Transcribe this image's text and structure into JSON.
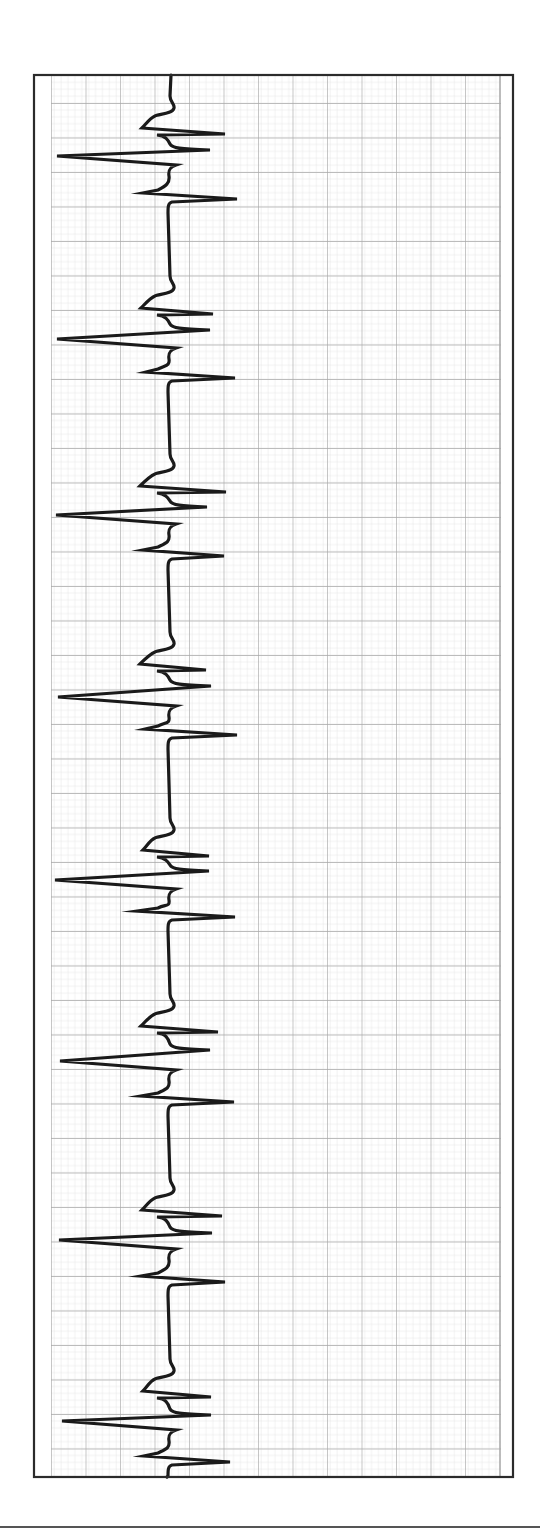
{
  "figure": {
    "caption_visible": "",
    "colors": {
      "frame": "#2b2b2b",
      "trace": "#1a1a1a",
      "grid_major": "#a8a8a8",
      "grid_minor": "#dddddd",
      "background": "#ffffff",
      "rule": "#555555"
    }
  },
  "chart_data": {
    "type": "line",
    "title": "",
    "xlabel": "",
    "ylabel": "",
    "orientation": "vertical strip (time runs top to bottom, amplitude left-right)",
    "grid": {
      "on": true,
      "major_spacing_px": 34.5,
      "minor_per_major": 5,
      "x_start_px": 51,
      "x_end_px": 500,
      "y_offset_px": 103
    },
    "frame_px": {
      "left": 33,
      "top": 74,
      "right": 514,
      "bottom": 1478
    },
    "baseline_x_px": 170,
    "beat_count": 8,
    "rr_interval_px": 181,
    "beats": [
      {
        "hook1": [
          142,
          128
        ],
        "spike1_x": 225,
        "spike2": [
          210,
          150
        ],
        "big_deflection": [
          57,
          156
        ],
        "hook2": [
          143,
          193
        ],
        "spike3_x": 237
      },
      {
        "hook1": [
          141,
          308
        ],
        "spike1_x": 213,
        "spike2": [
          210,
          330
        ],
        "big_deflection": [
          57,
          339
        ],
        "hook2": [
          146,
          372
        ],
        "spike3_x": 235
      },
      {
        "hook1": [
          140,
          486
        ],
        "spike1_x": 226,
        "spike2": [
          207,
          507
        ],
        "big_deflection": [
          56,
          515
        ],
        "hook2": [
          143,
          550
        ],
        "spike3_x": 224
      },
      {
        "hook1": [
          140,
          664
        ],
        "spike1_x": 206,
        "spike2": [
          211,
          686
        ],
        "big_deflection": [
          58,
          697
        ],
        "hook2": [
          145,
          729
        ],
        "spike3_x": 237
      },
      {
        "hook1": [
          143,
          850
        ],
        "spike1_x": 209,
        "spike2": [
          209,
          871
        ],
        "big_deflection": [
          55,
          880
        ],
        "hook2": [
          137,
          911
        ],
        "spike3_x": 235
      },
      {
        "hook1": [
          141,
          1026
        ],
        "spike1_x": 218,
        "spike2": [
          210,
          1050
        ],
        "big_deflection": [
          60,
          1061
        ],
        "hook2": [
          141,
          1096
        ],
        "spike3_x": 234
      },
      {
        "hook1": [
          142,
          1210
        ],
        "spike1_x": 222,
        "spike2": [
          212,
          1233
        ],
        "big_deflection": [
          59,
          1240
        ],
        "hook2": [
          141,
          1276
        ],
        "spike3_x": 225
      },
      {
        "hook1": [
          143,
          1391
        ],
        "spike1_x": 211,
        "spike2": [
          211,
          1415
        ],
        "big_deflection": [
          62,
          1421
        ],
        "hook2": [
          144,
          1456
        ],
        "spike3_x": 230
      }
    ]
  }
}
